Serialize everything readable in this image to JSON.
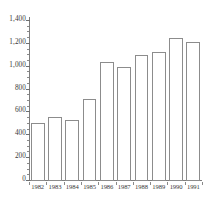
{
  "chart_data": {
    "type": "bar",
    "title": "",
    "subtitle": "",
    "xlabel": "",
    "ylabel": "",
    "categories": [
      "1982",
      "1983",
      "1984",
      "1985",
      "1986",
      "1987",
      "1988",
      "1989",
      "1990",
      "1991"
    ],
    "values": [
      510,
      560,
      530,
      720,
      1040,
      995,
      1100,
      1130,
      1250,
      1215
    ],
    "series": [
      {
        "name": "",
        "values": [
          510,
          560,
          530,
          720,
          1040,
          995,
          1100,
          1130,
          1250,
          1215
        ]
      }
    ],
    "ylim": [
      0,
      1400
    ],
    "ytick_values": [
      0,
      200,
      400,
      600,
      800,
      1000,
      1200,
      1400
    ],
    "ytick_labels": [
      "0",
      "200",
      "400",
      "600",
      "800",
      "1,000",
      "1,200",
      "1,400"
    ],
    "ytick_minor_step": 50,
    "grid": false,
    "legend": null,
    "legend_position": "none",
    "annotations": [],
    "bar_fill_color": "#ffffff",
    "bar_border_color": "#8c8c8c",
    "axis_color": "#7d7d7d",
    "text_color": "#3a3a3a",
    "background_color": "#ffffff"
  }
}
